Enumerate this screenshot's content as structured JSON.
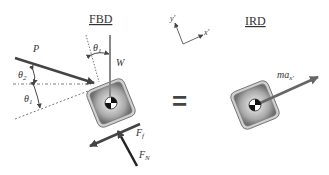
{
  "fbd": {
    "title": "FBD",
    "labels": {
      "P": "P",
      "W": "W",
      "theta1_top": "θ",
      "theta1_top_sub": "1",
      "theta2": "θ",
      "theta2_sub": "2",
      "theta1_left": "θ",
      "theta1_left_sub": "1",
      "Ff": "F",
      "Ff_sub": "f",
      "FN": "F",
      "FN_sub": "N"
    }
  },
  "equals": "=",
  "axes": {
    "y_label": "y'",
    "x_label": "x'"
  },
  "ird": {
    "title": "IRD",
    "labels": {
      "ma": "ma",
      "ma_sub": "x'"
    }
  },
  "colors": {
    "arrow": "#444444",
    "block_outer": "#8a8a8a",
    "block_inner": "#bdbdbd",
    "text": "#333333"
  }
}
